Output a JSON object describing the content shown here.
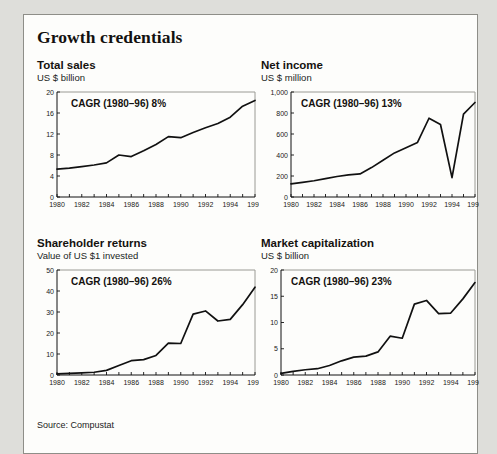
{
  "panel": {
    "title": "Growth credentials",
    "source": "Source: Compustat"
  },
  "chart_data": [
    {
      "type": "line",
      "name": "total-sales",
      "title": "Total sales",
      "subtitle": "US $ billion",
      "annotation": "CAGR (1980–96) 8%",
      "xlabel": "",
      "ylabel": "US $ billion",
      "grid": false,
      "legend": "none",
      "xlim": [
        1980,
        1996
      ],
      "ylim": [
        0,
        20
      ],
      "yticks": [
        0,
        4,
        8,
        12,
        16,
        20
      ],
      "ytick_labels": [
        "0",
        "4",
        "8",
        "12",
        "16",
        "20"
      ],
      "xticks": [
        1980,
        1982,
        1984,
        1986,
        1988,
        1990,
        1992,
        1994,
        1996
      ],
      "xtick_labels": [
        "1980",
        "1982",
        "1984",
        "1986",
        "1988",
        "1990",
        "1992",
        "1994",
        "1996"
      ],
      "x": [
        1980,
        1981,
        1982,
        1983,
        1984,
        1985,
        1986,
        1987,
        1988,
        1989,
        1990,
        1991,
        1992,
        1993,
        1994,
        1995,
        1996
      ],
      "values": [
        5.3,
        5.5,
        5.8,
        6.1,
        6.5,
        8.0,
        7.7,
        8.8,
        10.0,
        11.5,
        11.3,
        12.3,
        13.2,
        14.0,
        15.2,
        17.3,
        18.4
      ]
    },
    {
      "type": "line",
      "name": "net-income",
      "title": "Net income",
      "subtitle": "US $ million",
      "annotation": "CAGR (1980–96) 13%",
      "xlabel": "",
      "ylabel": "US $ million",
      "grid": false,
      "legend": "none",
      "xlim": [
        1980,
        1996
      ],
      "ylim": [
        0,
        1000
      ],
      "yticks": [
        0,
        200,
        400,
        600,
        800,
        1000
      ],
      "ytick_labels": [
        "0",
        "200",
        "400",
        "600",
        "800",
        "1,000"
      ],
      "xticks": [
        1980,
        1982,
        1984,
        1986,
        1988,
        1990,
        1992,
        1994,
        1996
      ],
      "xtick_labels": [
        "1980",
        "1982",
        "1984",
        "1986",
        "1988",
        "1990",
        "1992",
        "1994",
        "1996"
      ],
      "x": [
        1980,
        1981,
        1982,
        1983,
        1984,
        1985,
        1986,
        1987,
        1988,
        1989,
        1990,
        1991,
        1992,
        1993,
        1994,
        1995,
        1996
      ],
      "values": [
        125,
        140,
        155,
        175,
        195,
        210,
        220,
        280,
        350,
        420,
        470,
        520,
        750,
        690,
        185,
        790,
        900
      ]
    },
    {
      "type": "line",
      "name": "shareholder-returns",
      "title": "Shareholder returns",
      "subtitle": "Value of US $1 invested",
      "annotation": "CAGR (1980–96) 26%",
      "xlabel": "",
      "ylabel": "Value of US $1 invested",
      "grid": false,
      "legend": "none",
      "xlim": [
        1980,
        1996
      ],
      "ylim": [
        0,
        50
      ],
      "yticks": [
        0,
        10,
        20,
        30,
        40,
        50
      ],
      "ytick_labels": [
        "0",
        "10",
        "20",
        "30",
        "40",
        "50"
      ],
      "xticks": [
        1980,
        1982,
        1984,
        1986,
        1988,
        1990,
        1992,
        1994,
        1996
      ],
      "xtick_labels": [
        "1980",
        "1982",
        "1984",
        "1986",
        "1988",
        "1990",
        "1992",
        "1994",
        "1996"
      ],
      "x": [
        1980,
        1981,
        1982,
        1983,
        1984,
        1985,
        1986,
        1987,
        1988,
        1989,
        1990,
        1991,
        1992,
        1993,
        1994,
        1995,
        1996
      ],
      "values": [
        0.5,
        0.8,
        1.0,
        1.3,
        2.2,
        4.5,
        6.8,
        7.3,
        9.3,
        15.2,
        15.0,
        29.0,
        30.5,
        25.7,
        26.5,
        33.5,
        41.8
      ]
    },
    {
      "type": "line",
      "name": "market-capitalization",
      "title": "Market capitalization",
      "subtitle": "US $ billion",
      "annotation": "CAGR (1980–96) 23%",
      "xlabel": "",
      "ylabel": "US $ billion",
      "grid": false,
      "legend": "none",
      "xlim": [
        1980,
        1996
      ],
      "ylim": [
        0,
        20
      ],
      "yticks": [
        0,
        5,
        10,
        15,
        20
      ],
      "ytick_labels": [
        "0",
        "5",
        "10",
        "15",
        "20"
      ],
      "xticks": [
        1980,
        1982,
        1984,
        1986,
        1988,
        1990,
        1992,
        1994,
        1996
      ],
      "xtick_labels": [
        "1980",
        "1982",
        "1984",
        "1986",
        "1988",
        "1990",
        "1992",
        "1994",
        "1996"
      ],
      "x": [
        1980,
        1981,
        1982,
        1983,
        1984,
        1985,
        1986,
        1987,
        1988,
        1989,
        1990,
        1991,
        1992,
        1993,
        1994,
        1995,
        1996
      ],
      "values": [
        0.3,
        0.7,
        1.0,
        1.2,
        1.8,
        2.7,
        3.4,
        3.6,
        4.4,
        7.4,
        7.0,
        13.5,
        14.2,
        11.7,
        11.8,
        14.5,
        17.6
      ]
    }
  ]
}
